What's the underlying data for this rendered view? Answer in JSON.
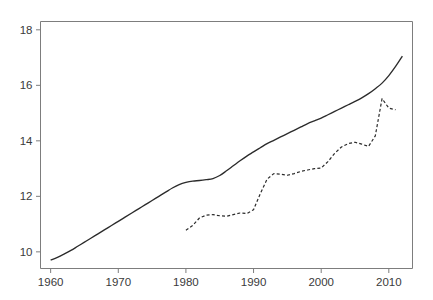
{
  "chart_data": {
    "type": "line",
    "title": "",
    "subtitle": "",
    "xlabel": "",
    "ylabel": "",
    "xlim": [
      1958.5,
      2013.5
    ],
    "ylim": [
      9.4,
      18.3
    ],
    "xticks": [
      1960,
      1970,
      1980,
      1990,
      2000,
      2010
    ],
    "yticks": [
      10,
      12,
      14,
      16,
      18
    ],
    "xtick_labels": [
      "1960",
      "1970",
      "1980",
      "1990",
      "2000",
      "2010"
    ],
    "ytick_labels": [
      "10",
      "12",
      "14",
      "16",
      "18"
    ],
    "grid": false,
    "legend": null,
    "legend_position": "none",
    "annotations": [],
    "frame": true,
    "series": [
      {
        "name": "solid-series",
        "style": "solid",
        "color": "#2b2b2b",
        "x": [
          1960,
          1961,
          1962,
          1963,
          1964,
          1965,
          1966,
          1967,
          1968,
          1969,
          1970,
          1971,
          1972,
          1973,
          1974,
          1975,
          1976,
          1977,
          1978,
          1979,
          1980,
          1981,
          1982,
          1983,
          1984,
          1985,
          1986,
          1987,
          1988,
          1989,
          1990,
          1991,
          1992,
          1993,
          1994,
          1995,
          1996,
          1997,
          1998,
          1999,
          2000,
          2001,
          2002,
          2003,
          2004,
          2005,
          2006,
          2007,
          2008,
          2009,
          2010,
          2011,
          2012
        ],
        "y": [
          9.7,
          9.8,
          9.92,
          10.05,
          10.2,
          10.35,
          10.5,
          10.65,
          10.8,
          10.95,
          11.1,
          11.25,
          11.4,
          11.55,
          11.7,
          11.85,
          12.0,
          12.15,
          12.3,
          12.42,
          12.5,
          12.55,
          12.57,
          12.6,
          12.64,
          12.75,
          12.92,
          13.1,
          13.28,
          13.45,
          13.6,
          13.75,
          13.9,
          14.02,
          14.14,
          14.26,
          14.38,
          14.5,
          14.62,
          14.72,
          14.82,
          14.94,
          15.06,
          15.18,
          15.3,
          15.42,
          15.55,
          15.7,
          15.88,
          16.08,
          16.35,
          16.68,
          17.05
        ]
      },
      {
        "name": "dashed-series",
        "style": "dashed",
        "color": "#2b2b2b",
        "x": [
          1980,
          1981,
          1982,
          1983,
          1984,
          1985,
          1986,
          1987,
          1988,
          1989,
          1990,
          1991,
          1992,
          1993,
          1994,
          1995,
          1996,
          1997,
          1998,
          1999,
          2000,
          2001,
          2002,
          2003,
          2004,
          2005,
          2006,
          2007,
          2008,
          2009,
          2010,
          2011
        ],
        "y": [
          10.78,
          10.95,
          11.22,
          11.32,
          11.34,
          11.3,
          11.28,
          11.34,
          11.4,
          11.38,
          11.52,
          12.1,
          12.62,
          12.82,
          12.8,
          12.76,
          12.82,
          12.9,
          12.95,
          13.0,
          13.02,
          13.25,
          13.55,
          13.78,
          13.9,
          13.95,
          13.88,
          13.8,
          14.18,
          15.52,
          15.18,
          15.12
        ]
      }
    ]
  }
}
